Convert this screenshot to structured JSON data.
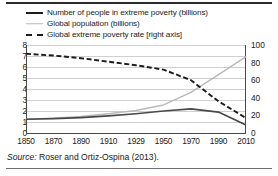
{
  "figure": {
    "caption_label": "Source:",
    "caption_text": " Roser and Ortiz-Ospina (2013)."
  },
  "legend": {
    "position": "top",
    "items": [
      {
        "label": "Number of people in extreme poverty (billions)",
        "style": "solid",
        "color": "#1c1c1c",
        "icon": "line-solid-dark-icon"
      },
      {
        "label": "Global population (billions)",
        "style": "solid",
        "color": "#b9b9b9",
        "icon": "line-solid-gray-icon"
      },
      {
        "label": "Global extreme poverty rate [right axis]",
        "style": "dashed",
        "color": "#1c1c1c",
        "icon": "line-dashed-dark-icon"
      }
    ]
  },
  "chart_data": {
    "type": "line",
    "title": "",
    "subtitle": "",
    "xlabel": "",
    "ylabel": "",
    "y2label": "",
    "grid": true,
    "legend_position": "top",
    "xlim": [
      1850,
      2010
    ],
    "ylim": [
      0,
      8
    ],
    "y2lim": [
      0,
      100
    ],
    "yticks": [
      0,
      1,
      2,
      3,
      4,
      5,
      6,
      7,
      8
    ],
    "y2ticks": [
      0,
      20,
      40,
      60,
      80,
      100
    ],
    "xticks": [
      1850,
      1870,
      1890,
      1910,
      1929,
      1950,
      1970,
      1990,
      2010
    ],
    "xtick_labels": [
      "1850",
      "1870",
      "1890",
      "1910",
      "1929",
      "1950",
      "1970",
      "1990",
      "2010"
    ],
    "x": [
      1850,
      1870,
      1890,
      1910,
      1929,
      1950,
      1970,
      1990,
      2010
    ],
    "series": [
      {
        "name": "Number of people in extreme poverty (billions)",
        "axis": "left",
        "style": "solid",
        "color": "#4a4a4a",
        "values": [
          1.25,
          1.3,
          1.4,
          1.55,
          1.75,
          2.0,
          2.2,
          1.9,
          0.72
        ]
      },
      {
        "name": "Global population (billions)",
        "axis": "left",
        "style": "solid",
        "color": "#b9b9b9",
        "values": [
          1.26,
          1.35,
          1.5,
          1.75,
          2.05,
          2.55,
          3.7,
          5.3,
          6.95
        ]
      },
      {
        "name": "Global extreme poverty rate [right axis]",
        "axis": "right",
        "style": "dashed",
        "color": "#1c1c1c",
        "values": [
          90,
          88,
          85,
          81,
          77,
          72,
          60,
          36,
          17
        ]
      }
    ]
  }
}
